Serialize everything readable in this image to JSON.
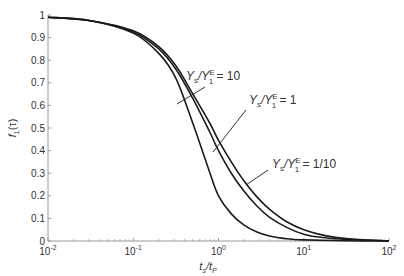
{
  "chart_data": {
    "type": "line",
    "title": "",
    "xlabel": "t_s/t_P",
    "ylabel": "f_1(τ)",
    "xscale": "log",
    "xlim": [
      0.01,
      100
    ],
    "ylim": [
      0,
      1
    ],
    "grid": false,
    "x_ticks": [
      "10^-2",
      "10^-1",
      "10^0",
      "10^1",
      "10^2"
    ],
    "y_ticks": [
      "0",
      "0.1",
      "0.2",
      "0.3",
      "0.4",
      "0.5",
      "0.6",
      "0.7",
      "0.8",
      "0.9",
      "1"
    ],
    "series": [
      {
        "name": "Ys/Y1E = 10",
        "log10_x": [
          -2,
          -1.5,
          -1,
          -0.7,
          -0.5,
          -0.3,
          -0.1,
          0,
          0.15,
          0.3,
          0.45,
          0.6,
          0.8,
          1,
          1.5,
          2
        ],
        "values": [
          0.99,
          0.975,
          0.92,
          0.83,
          0.72,
          0.52,
          0.3,
          0.2,
          0.12,
          0.07,
          0.04,
          0.022,
          0.01,
          0.005,
          0.001,
          0
        ]
      },
      {
        "name": "Ys/Y1E = 1",
        "log10_x": [
          -2,
          -1.5,
          -1,
          -0.7,
          -0.5,
          -0.3,
          -0.1,
          0,
          0.15,
          0.3,
          0.45,
          0.6,
          0.8,
          1,
          1.25,
          1.5,
          2
        ],
        "values": [
          0.99,
          0.975,
          0.925,
          0.85,
          0.76,
          0.63,
          0.48,
          0.4,
          0.3,
          0.22,
          0.155,
          0.105,
          0.06,
          0.03,
          0.014,
          0.007,
          0
        ]
      },
      {
        "name": "Ys/Y1E = 1/10",
        "log10_x": [
          -2,
          -1.5,
          -1,
          -0.7,
          -0.5,
          -0.3,
          -0.1,
          0,
          0.15,
          0.3,
          0.45,
          0.6,
          0.8,
          1,
          1.25,
          1.5,
          2
        ],
        "values": [
          0.99,
          0.975,
          0.93,
          0.86,
          0.775,
          0.65,
          0.52,
          0.445,
          0.35,
          0.265,
          0.195,
          0.14,
          0.085,
          0.05,
          0.024,
          0.011,
          0
        ]
      }
    ],
    "annotations": [
      {
        "label": "Ys/Y1E = 10",
        "base": "Y",
        "sub1": "s",
        "mid": "/Y",
        "sup": "E",
        "sub2": "1",
        "rhs": " = 10"
      },
      {
        "label": "Ys/Y1E = 1",
        "base": "Y",
        "sub1": "s",
        "mid": "/Y",
        "sup": "E",
        "sub2": "1",
        "rhs": " = 1"
      },
      {
        "label": "Ys/Y1E = 1/10",
        "base": "Y",
        "sub1": "s",
        "mid": "/Y",
        "sup": "E",
        "sub2": "1",
        "rhs": " = 1/10"
      }
    ],
    "legend_position": "inline annotations with leader lines"
  },
  "axes": {
    "xlabel_main": "t",
    "xlabel_sub1": "s",
    "xlabel_slash": "/t",
    "xlabel_sub2": "P",
    "ylabel_main": "f",
    "ylabel_sub": "1",
    "ylabel_arg": "(τ)",
    "x_tick_base": "10",
    "x_tick_exps": [
      "-2",
      "-1",
      "0",
      "1",
      "2"
    ]
  },
  "colors": {
    "axis": "#9a9a9a",
    "curve": "#1a1a1a",
    "text": "#333333"
  }
}
